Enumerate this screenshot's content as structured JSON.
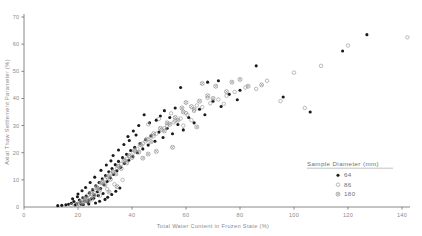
{
  "chart_data": {
    "type": "scatter",
    "title": "",
    "xlabel": "Total Water Content in Frozen State (%)",
    "ylabel": "Axial Thaw Settlement Parameter (%)",
    "xlim": [
      0,
      145
    ],
    "ylim": [
      0,
      70
    ],
    "xticks": [
      0,
      20,
      40,
      60,
      80,
      100,
      120,
      140
    ],
    "yticks": [
      0,
      10,
      20,
      30,
      40,
      50,
      60,
      70
    ],
    "grid": false,
    "legend_position": "lower-right",
    "legend_title": "Sample Diameter (mm)",
    "series": [
      {
        "name": "64",
        "marker": "filled-circle",
        "color": "#1a1a1a",
        "points": [
          [
            18.5,
            2.0
          ],
          [
            19.5,
            1.2
          ],
          [
            20.5,
            2.6
          ],
          [
            21.0,
            1.6
          ],
          [
            21.8,
            3.4
          ],
          [
            22.4,
            2.2
          ],
          [
            23.0,
            4.0
          ],
          [
            23.6,
            1.8
          ],
          [
            24.2,
            5.2
          ],
          [
            24.8,
            3.0
          ],
          [
            25.4,
            6.4
          ],
          [
            26.0,
            4.4
          ],
          [
            26.6,
            7.8
          ],
          [
            27.2,
            5.6
          ],
          [
            27.8,
            9.0
          ],
          [
            28.4,
            6.8
          ],
          [
            29.0,
            10.4
          ],
          [
            29.6,
            8.2
          ],
          [
            30.2,
            11.6
          ],
          [
            30.8,
            9.4
          ],
          [
            31.4,
            13.0
          ],
          [
            32.0,
            10.8
          ],
          [
            32.6,
            14.2
          ],
          [
            33.2,
            12.0
          ],
          [
            33.8,
            15.6
          ],
          [
            34.4,
            13.4
          ],
          [
            35.0,
            16.8
          ],
          [
            35.8,
            14.6
          ],
          [
            36.5,
            18.2
          ],
          [
            37.2,
            16.0
          ],
          [
            38.0,
            19.4
          ],
          [
            38.8,
            17.2
          ],
          [
            39.5,
            20.8
          ],
          [
            40.3,
            18.6
          ],
          [
            41.0,
            22.0
          ],
          [
            42.0,
            20.0
          ],
          [
            43.0,
            23.4
          ],
          [
            44.0,
            21.4
          ],
          [
            45.0,
            24.8
          ],
          [
            46.0,
            22.8
          ],
          [
            47.0,
            26.2
          ],
          [
            48.5,
            24.2
          ],
          [
            50.0,
            27.6
          ],
          [
            51.5,
            25.6
          ],
          [
            53.0,
            29.0
          ],
          [
            55.0,
            27.0
          ],
          [
            57.0,
            30.4
          ],
          [
            59.0,
            28.4
          ],
          [
            61.0,
            33.0
          ],
          [
            63.0,
            31.0
          ],
          [
            14.0,
            0.6
          ],
          [
            15.5,
            0.8
          ],
          [
            16.5,
            1.0
          ],
          [
            17.5,
            1.4
          ],
          [
            12.5,
            0.5
          ],
          [
            22.0,
            0.9
          ],
          [
            24.0,
            1.1
          ],
          [
            26.5,
            1.5
          ],
          [
            28.0,
            2.1
          ],
          [
            30.0,
            2.8
          ],
          [
            31.0,
            3.6
          ],
          [
            32.5,
            4.6
          ],
          [
            34.0,
            5.8
          ],
          [
            35.5,
            7.0
          ],
          [
            29.3,
            5.0
          ],
          [
            27.5,
            4.2
          ],
          [
            25.8,
            3.2
          ],
          [
            23.8,
            2.4
          ],
          [
            21.2,
            1.0
          ],
          [
            19.0,
            0.7
          ],
          [
            65.0,
            36.0
          ],
          [
            67.0,
            34.0
          ],
          [
            70.0,
            39.0
          ],
          [
            73.0,
            37.0
          ],
          [
            76.0,
            41.5
          ],
          [
            79.0,
            39.5
          ],
          [
            58.0,
            44.0
          ],
          [
            68.0,
            46.0
          ],
          [
            72.0,
            46.5
          ],
          [
            80.0,
            43.0
          ],
          [
            86.0,
            52.0
          ],
          [
            96.0,
            40.5
          ],
          [
            106.0,
            35.0
          ],
          [
            118.0,
            57.5
          ],
          [
            127.0,
            63.5
          ],
          [
            44.5,
            34.0
          ],
          [
            49.0,
            32.0
          ],
          [
            52.0,
            35.5
          ],
          [
            54.0,
            33.0
          ],
          [
            56.0,
            36.5
          ],
          [
            38.5,
            26.0
          ],
          [
            40.5,
            28.0
          ],
          [
            42.5,
            30.0
          ],
          [
            46.5,
            31.0
          ],
          [
            50.5,
            33.5
          ],
          [
            33.0,
            19.0
          ],
          [
            35.0,
            21.0
          ],
          [
            37.0,
            23.0
          ],
          [
            39.0,
            24.5
          ],
          [
            41.5,
            26.5
          ],
          [
            28.5,
            13.5
          ],
          [
            30.5,
            15.5
          ],
          [
            32.2,
            17.0
          ],
          [
            26.2,
            11.0
          ],
          [
            24.5,
            9.0
          ],
          [
            20.0,
            4.8
          ],
          [
            21.5,
            6.0
          ],
          [
            22.8,
            7.2
          ],
          [
            19.8,
            3.8
          ],
          [
            18.0,
            3.0
          ]
        ]
      },
      {
        "name": "86",
        "marker": "open-circle",
        "color": "#9e9e9e",
        "points": [
          [
            21.0,
            2.0
          ],
          [
            22.5,
            3.2
          ],
          [
            24.0,
            4.6
          ],
          [
            25.5,
            6.0
          ],
          [
            27.0,
            7.4
          ],
          [
            28.5,
            8.8
          ],
          [
            30.0,
            10.2
          ],
          [
            31.5,
            11.6
          ],
          [
            33.0,
            13.0
          ],
          [
            34.5,
            14.4
          ],
          [
            36.0,
            15.8
          ],
          [
            37.5,
            17.2
          ],
          [
            39.0,
            18.6
          ],
          [
            40.5,
            20.0
          ],
          [
            42.0,
            21.4
          ],
          [
            43.5,
            22.8
          ],
          [
            45.0,
            24.2
          ],
          [
            47.0,
            25.6
          ],
          [
            49.0,
            27.0
          ],
          [
            51.0,
            28.4
          ],
          [
            53.0,
            29.8
          ],
          [
            55.5,
            31.2
          ],
          [
            58.0,
            32.6
          ],
          [
            60.5,
            34.0
          ],
          [
            63.0,
            35.4
          ],
          [
            66.0,
            36.8
          ],
          [
            69.0,
            38.2
          ],
          [
            72.0,
            39.6
          ],
          [
            75.0,
            41.0
          ],
          [
            78.0,
            42.4
          ],
          [
            20.0,
            1.2
          ],
          [
            23.0,
            2.4
          ],
          [
            26.0,
            5.2
          ],
          [
            29.0,
            9.4
          ],
          [
            32.0,
            12.2
          ],
          [
            35.0,
            15.0
          ],
          [
            38.0,
            17.8
          ],
          [
            41.0,
            20.6
          ],
          [
            44.0,
            23.4
          ],
          [
            48.0,
            26.2
          ],
          [
            52.0,
            29.0
          ],
          [
            56.0,
            31.8
          ],
          [
            60.0,
            34.6
          ],
          [
            64.0,
            37.4
          ],
          [
            68.0,
            40.2
          ],
          [
            74.0,
            38.0
          ],
          [
            82.0,
            44.0
          ],
          [
            90.0,
            46.5
          ],
          [
            100.0,
            49.5
          ],
          [
            110.0,
            52.0
          ],
          [
            120.0,
            59.5
          ],
          [
            142.0,
            62.5
          ],
          [
            95.0,
            39.0
          ],
          [
            104.0,
            36.5
          ],
          [
            86.0,
            43.5
          ],
          [
            30.8,
            6.6
          ],
          [
            33.5,
            8.4
          ],
          [
            36.5,
            10.0
          ],
          [
            28.2,
            4.2
          ],
          [
            25.2,
            2.8
          ],
          [
            46.0,
            30.5
          ],
          [
            50.0,
            32.5
          ],
          [
            54.5,
            34.5
          ],
          [
            59.0,
            30.0
          ],
          [
            62.0,
            32.0
          ],
          [
            19.0,
            0.8
          ],
          [
            17.5,
            0.6
          ],
          [
            22.0,
            1.6
          ],
          [
            24.5,
            3.6
          ],
          [
            27.5,
            6.8
          ]
        ]
      },
      {
        "name": "180",
        "marker": "crossed-circle",
        "color": "#8c8c8c",
        "points": [
          [
            23.0,
            3.0
          ],
          [
            25.0,
            5.0
          ],
          [
            27.0,
            7.0
          ],
          [
            29.0,
            9.0
          ],
          [
            31.0,
            11.0
          ],
          [
            33.0,
            13.0
          ],
          [
            35.0,
            15.0
          ],
          [
            37.0,
            17.0
          ],
          [
            39.0,
            19.0
          ],
          [
            41.0,
            21.0
          ],
          [
            43.0,
            23.0
          ],
          [
            45.5,
            25.0
          ],
          [
            48.0,
            27.0
          ],
          [
            50.5,
            29.0
          ],
          [
            53.0,
            31.0
          ],
          [
            56.0,
            33.0
          ],
          [
            59.0,
            35.0
          ],
          [
            62.0,
            37.0
          ],
          [
            65.0,
            39.0
          ],
          [
            68.0,
            41.0
          ],
          [
            24.0,
            2.2
          ],
          [
            26.0,
            4.2
          ],
          [
            28.0,
            6.2
          ],
          [
            30.0,
            8.2
          ],
          [
            32.0,
            10.2
          ],
          [
            34.0,
            12.2
          ],
          [
            36.0,
            14.2
          ],
          [
            38.0,
            16.2
          ],
          [
            40.0,
            18.2
          ],
          [
            42.5,
            20.2
          ],
          [
            47.0,
            24.0
          ],
          [
            52.0,
            28.0
          ],
          [
            57.0,
            32.0
          ],
          [
            63.0,
            36.0
          ],
          [
            70.0,
            40.0
          ],
          [
            46.0,
            19.5
          ],
          [
            55.0,
            22.0
          ],
          [
            64.0,
            29.5
          ],
          [
            71.0,
            44.5
          ],
          [
            77.0,
            46.0
          ],
          [
            80.0,
            47.0
          ],
          [
            66.0,
            45.5
          ],
          [
            60.0,
            38.5
          ],
          [
            49.0,
            20.5
          ],
          [
            44.0,
            18.0
          ],
          [
            21.5,
            1.8
          ],
          [
            22.8,
            2.6
          ],
          [
            20.5,
            1.0
          ],
          [
            31.5,
            5.5
          ],
          [
            34.5,
            7.5
          ],
          [
            75.0,
            42.5
          ],
          [
            83.0,
            44.5
          ],
          [
            88.0,
            45.0
          ],
          [
            58.5,
            36.5
          ],
          [
            54.0,
            30.5
          ]
        ]
      }
    ]
  },
  "legend": {
    "title": "Sample Diameter (mm)",
    "items": [
      {
        "label": "64",
        "marker": "filled-circle"
      },
      {
        "label": "86",
        "marker": "open-circle"
      },
      {
        "label": "180",
        "marker": "crossed-circle"
      }
    ]
  },
  "axes": {
    "x_title": "Total Water Content in Frozen State (%)",
    "y_title": "Axial Thaw Settlement Parameter (%)",
    "x_tick_labels": [
      "0",
      "20",
      "40",
      "60",
      "80",
      "100",
      "120",
      "140"
    ],
    "y_tick_labels": [
      "0",
      "10",
      "20",
      "30",
      "40",
      "50",
      "60",
      "70"
    ]
  },
  "colors": {
    "axis": "#6b6b6b",
    "text": "#8a8a8a",
    "series_64": "#1a1a1a",
    "series_86": "#9e9e9e",
    "series_180": "#8c8c8c",
    "background": "#ffffff"
  }
}
